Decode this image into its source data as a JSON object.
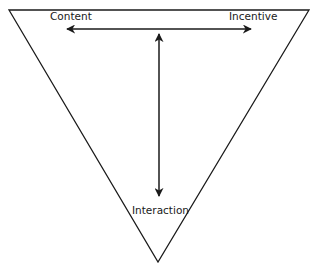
{
  "diagram": {
    "type": "inverted-triangle",
    "labels": {
      "content": "Content",
      "incentive": "Incentive",
      "interaction": "Interaction"
    },
    "arrows": [
      {
        "from": "content",
        "to": "incentive",
        "direction": "bidirectional",
        "orientation": "horizontal"
      },
      {
        "from": "top-edge",
        "to": "interaction",
        "direction": "bidirectional",
        "orientation": "vertical"
      }
    ],
    "colors": {
      "stroke": "#1a1a1a",
      "background": "#ffffff"
    }
  }
}
